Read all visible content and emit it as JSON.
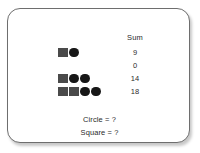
{
  "card": {
    "border_color": "#6e6e6e",
    "background_color": "#ffffff"
  },
  "table": {
    "sum_header": "Sum",
    "rows": [
      {
        "shapes": [
          "square",
          "circle"
        ],
        "sum": "9"
      },
      {
        "shapes": [],
        "sum": "0"
      },
      {
        "shapes": [
          "square",
          "circle",
          "circle"
        ],
        "sum": "14"
      },
      {
        "shapes": [
          "square",
          "square",
          "circle",
          "circle"
        ],
        "sum": "18"
      }
    ]
  },
  "questions": [
    "Circle = ?",
    "Square = ?"
  ],
  "shape_colors": {
    "square": "#4a4a4a",
    "circle": "#171717"
  },
  "chart_data": {
    "type": "table",
    "title": "",
    "columns": [
      "Shapes",
      "Sum"
    ],
    "categories": [
      "square+circle",
      "(empty)",
      "square+circle+circle",
      "square+square+circle+circle"
    ],
    "values": [
      9,
      0,
      14,
      18
    ],
    "annotations": [
      "Circle = ?",
      "Square = ?"
    ],
    "grid": false,
    "legend": ""
  }
}
